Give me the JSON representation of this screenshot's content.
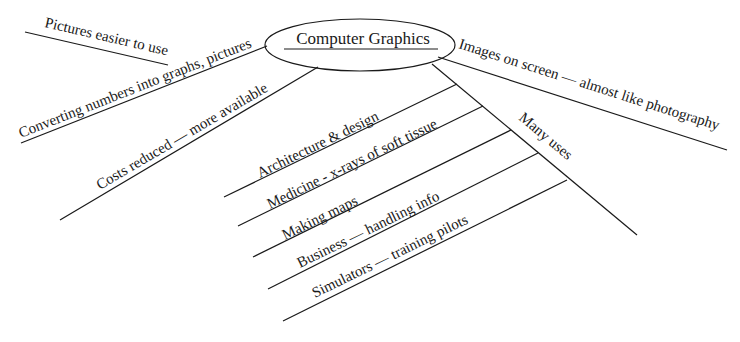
{
  "diagram": {
    "central": {
      "label": "Computer Graphics"
    },
    "branches": [
      {
        "id": "pictures",
        "label": "Pictures easier to use"
      },
      {
        "id": "converting",
        "label": "Converting numbers into graphs, pictures"
      },
      {
        "id": "costs",
        "label": "Costs reduced — more available"
      },
      {
        "id": "images",
        "label": "Images on screen — almost like photography"
      },
      {
        "id": "uses",
        "label": "Many uses",
        "children": [
          {
            "label": "Architecture & design"
          },
          {
            "label": "Medicine - x-rays of soft tissue"
          },
          {
            "label": "Making maps"
          },
          {
            "label": "Business — handling info"
          },
          {
            "label": "Simulators — training pilots"
          }
        ]
      }
    ]
  }
}
